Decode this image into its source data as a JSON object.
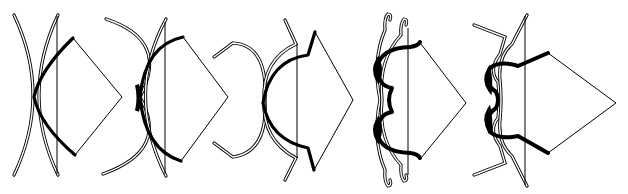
{
  "diagram": {
    "figures": [
      {
        "id": 1,
        "label": "simple-bow",
        "states": [
          "unstrung",
          "braced",
          "drawn"
        ]
      },
      {
        "id": 2,
        "label": "reflexed-bow",
        "states": [
          "unstrung",
          "braced",
          "drawn"
        ]
      },
      {
        "id": 3,
        "label": "recurve-bow",
        "states": [
          "unstrung",
          "braced",
          "drawn"
        ]
      },
      {
        "id": 4,
        "label": "double-curved-bow",
        "states": [
          "unstrung",
          "braced",
          "drawn"
        ]
      },
      {
        "id": 5,
        "label": "angular-double-curved-bow",
        "states": [
          "unstrung",
          "braced",
          "drawn"
        ]
      }
    ],
    "colors": {
      "line": "#000000",
      "background": "#ffffff"
    }
  }
}
